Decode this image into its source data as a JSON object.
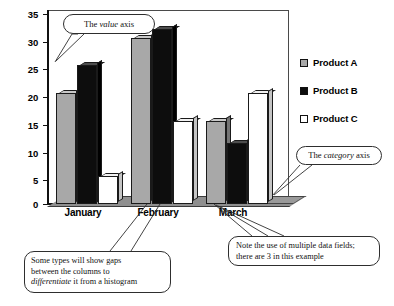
{
  "chart_data": {
    "type": "bar",
    "title": "",
    "xlabel": "",
    "ylabel": "",
    "categories": [
      "January",
      "February",
      "March"
    ],
    "series": [
      {
        "name": "Product A",
        "values": [
          20,
          30,
          15
        ],
        "color": "#a8a8a8"
      },
      {
        "name": "Product B",
        "values": [
          25,
          31.5,
          11
        ],
        "color": "#0d0d0d"
      },
      {
        "name": "Product C",
        "values": [
          5,
          15,
          20
        ],
        "color": "#ffffff"
      }
    ],
    "ylim": [
      0,
      35
    ],
    "yticks": [
      0,
      5,
      10,
      15,
      20,
      25,
      30,
      35
    ],
    "grid": false,
    "legend_position": "right",
    "style": "3d-column"
  },
  "axis": {
    "ticks": [
      "0",
      "5",
      "10",
      "15",
      "20",
      "25",
      "30",
      "35"
    ]
  },
  "categories": {
    "january": "January",
    "february": "February",
    "march": "March"
  },
  "legend": {
    "items": [
      {
        "label": "Product A",
        "swatch": "gray-swatch"
      },
      {
        "label": "Product B",
        "swatch": "black-swatch"
      },
      {
        "label": "Product C",
        "swatch": "white-swatch"
      }
    ]
  },
  "callouts": {
    "value_axis": {
      "prefix": "The ",
      "emphasis": "value",
      "suffix": " axis"
    },
    "category_axis": {
      "prefix": "The ",
      "emphasis": "category",
      "suffix": " axis"
    },
    "gaps": {
      "line1": "Some types will show gaps",
      "line2": "between the columns to",
      "line3_emphasis": "differentiate",
      "line3_rest": " it from a histogram"
    },
    "fields": {
      "line1": "Note the use of multiple data fields;",
      "line2": "there are 3 in this example"
    }
  }
}
